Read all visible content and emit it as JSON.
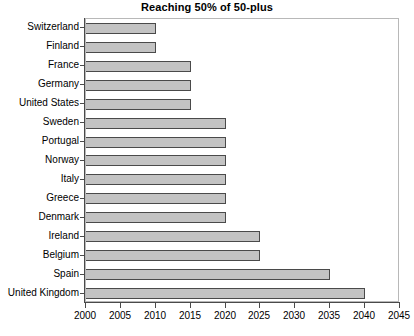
{
  "chart_data": {
    "type": "bar",
    "orientation": "horizontal",
    "title": "Reaching 50% of 50-plus",
    "xlabel": "",
    "ylabel": "",
    "xlim": [
      2000,
      2045
    ],
    "xticks": [
      2000,
      2005,
      2010,
      2015,
      2020,
      2025,
      2030,
      2035,
      2040,
      2045
    ],
    "xtick_labels": [
      "2000",
      "2005",
      "2010",
      "2015",
      "2020",
      "2025",
      "2030",
      "2035",
      "2040",
      "2045"
    ],
    "grid": false,
    "legend": "none",
    "bar_fill_color": "#c3c3c3",
    "bar_border_color": "#4a4a4a",
    "categories": [
      "Switzerland",
      "Finland",
      "France",
      "Germany",
      "United States",
      "Sweden",
      "Portugal",
      "Norway",
      "Italy",
      "Greece",
      "Denmark",
      "Ireland",
      "Belgium",
      "Spain",
      "United Kingdom"
    ],
    "values": [
      2010,
      2010,
      2015,
      2015,
      2015,
      2020,
      2020,
      2020,
      2020,
      2020,
      2020,
      2025,
      2025,
      2035,
      2040
    ]
  }
}
